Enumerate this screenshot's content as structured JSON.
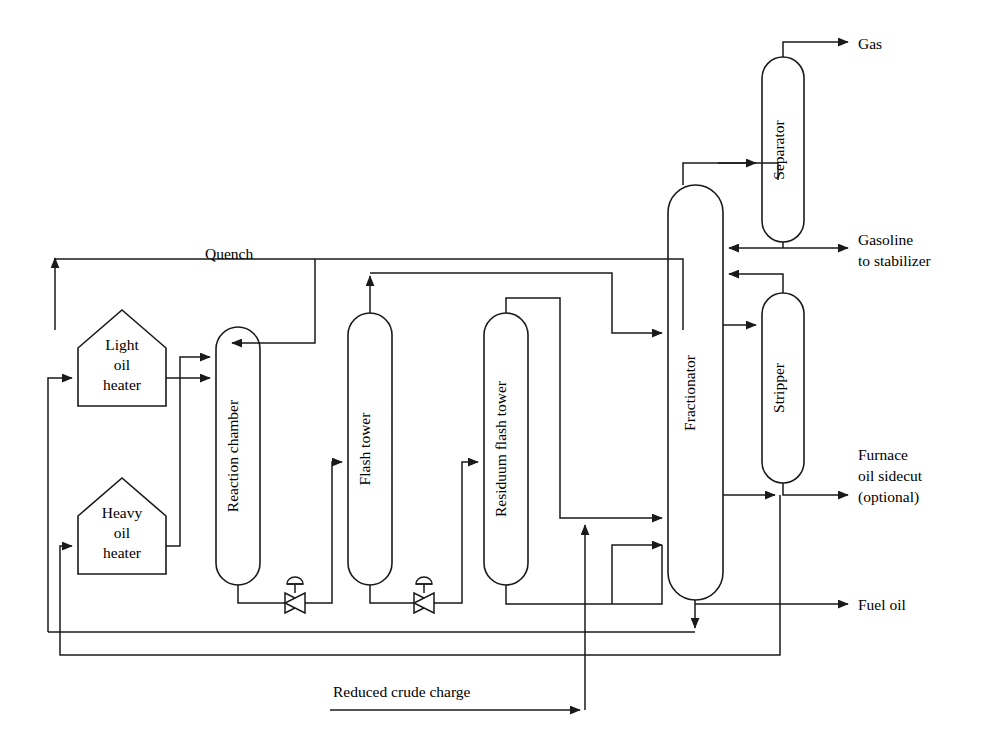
{
  "diagram": {
    "background_color": "#ffffff",
    "line_color": "#1a1a1a",
    "units": [
      {
        "id": "light-oil-heater",
        "label": "Light\noil\nheater",
        "label_lines": [
          "Light",
          "oil",
          "heater"
        ],
        "shape": "pentagon-heater",
        "x": 78,
        "y": 310,
        "w": 88,
        "h": 96
      },
      {
        "id": "heavy-oil-heater",
        "label": "Heavy\noil\nheater",
        "label_lines": [
          "Heavy",
          "oil",
          "heater"
        ],
        "shape": "pentagon-heater",
        "x": 78,
        "y": 478,
        "w": 88,
        "h": 96
      },
      {
        "id": "reaction-chamber",
        "label": "Reaction chamber",
        "shape": "vertical-vessel",
        "x": 216,
        "y": 327,
        "w": 44,
        "h": 258
      },
      {
        "id": "flash-tower",
        "label": "Flash tower",
        "shape": "vertical-vessel",
        "x": 348,
        "y": 313,
        "w": 44,
        "h": 272
      },
      {
        "id": "residuum-flash-tower",
        "label": "Residuum flash tower",
        "shape": "vertical-vessel",
        "x": 484,
        "y": 313,
        "w": 44,
        "h": 272
      },
      {
        "id": "fractionator",
        "label": "Fractionator",
        "shape": "vertical-vessel",
        "x": 668,
        "y": 185,
        "w": 55,
        "h": 415
      },
      {
        "id": "separator",
        "label": "Separator",
        "shape": "vertical-vessel",
        "x": 762,
        "y": 57,
        "w": 42,
        "h": 185
      },
      {
        "id": "stripper",
        "label": "Stripper",
        "shape": "vertical-vessel",
        "x": 762,
        "y": 293,
        "w": 42,
        "h": 190
      }
    ],
    "valves": [
      {
        "id": "reaction-chamber-outlet-valve",
        "type": "control-valve",
        "x": 295,
        "y": 598
      },
      {
        "id": "flash-tower-outlet-valve",
        "type": "control-valve",
        "x": 424,
        "y": 598
      }
    ],
    "stream_labels": [
      {
        "id": "quench-label",
        "text": "Quench",
        "lines": [
          "Quench"
        ],
        "x": 205,
        "y": 259,
        "anchor": "start"
      },
      {
        "id": "gas-label",
        "text": "Gas",
        "lines": [
          "Gas"
        ],
        "x": 858,
        "y": 52,
        "anchor": "start"
      },
      {
        "id": "gasoline-label",
        "text": "Gasoline to stabilizer",
        "lines": [
          "Gasoline",
          "to stabilizer"
        ],
        "x": 858,
        "y": 246,
        "anchor": "start"
      },
      {
        "id": "furnace-oil-label",
        "text": "Furnace oil sidecut (optional)",
        "lines": [
          "Furnace",
          "oil sidecut",
          "(optional)"
        ],
        "x": 858,
        "y": 452,
        "anchor": "start"
      },
      {
        "id": "fuel-oil-label",
        "text": "Fuel oil",
        "lines": [
          "Fuel oil"
        ],
        "x": 858,
        "y": 611,
        "anchor": "start"
      },
      {
        "id": "reduced-crude-charge-label",
        "text": "Reduced crude charge",
        "lines": [
          "Reduced crude charge"
        ],
        "x": 333,
        "y": 697,
        "anchor": "start"
      }
    ],
    "streams": [
      {
        "id": "reduced-crude-charge-line",
        "from": "reduced crude charge inlet",
        "to": "residuum flash tower / fractionator header"
      },
      {
        "id": "quench-line",
        "from": "fractionator overhead area",
        "to": "reaction chamber top"
      },
      {
        "id": "light-oil-feed",
        "from": "recycle header",
        "to": "light oil heater"
      },
      {
        "id": "heavy-oil-feed",
        "from": "recycle header",
        "to": "heavy oil heater"
      },
      {
        "id": "light-oil-to-reactor",
        "from": "light oil heater",
        "to": "reaction chamber"
      },
      {
        "id": "heavy-oil-to-reactor",
        "from": "heavy oil heater",
        "to": "reaction chamber"
      },
      {
        "id": "reactor-to-flash-tower",
        "from": "reaction chamber bottom",
        "to": "flash tower"
      },
      {
        "id": "flash-tower-overhead",
        "from": "flash tower top",
        "to": "fractionator"
      },
      {
        "id": "flash-bottoms-to-residuum",
        "from": "flash tower bottom",
        "to": "residuum flash tower"
      },
      {
        "id": "residuum-overhead",
        "from": "residuum flash tower top",
        "to": "fractionator feed header"
      },
      {
        "id": "residuum-bottoms",
        "from": "residuum flash tower bottom",
        "to": "fuel oil header"
      },
      {
        "id": "fractionator-to-separator",
        "from": "fractionator top",
        "to": "separator"
      },
      {
        "id": "separator-gas",
        "from": "separator top",
        "to": "gas outlet"
      },
      {
        "id": "separator-bottoms",
        "from": "separator bottom",
        "to": "fractionator reflux / gasoline to stabilizer"
      },
      {
        "id": "fractionator-to-stripper",
        "from": "fractionator",
        "to": "stripper"
      },
      {
        "id": "stripper-overhead",
        "from": "stripper top",
        "to": "fractionator"
      },
      {
        "id": "stripper-bottoms",
        "from": "stripper bottom",
        "to": "furnace oil sidecut (optional)"
      },
      {
        "id": "fractionator-sidecut-recycle",
        "from": "fractionator",
        "to": "fuel oil / recycle header"
      },
      {
        "id": "fractionator-bottoms",
        "from": "fractionator bottom",
        "to": "recycle to heaters"
      },
      {
        "id": "fuel-oil-outlet",
        "from": "fractionator bottoms header",
        "to": "fuel oil outlet"
      }
    ]
  }
}
